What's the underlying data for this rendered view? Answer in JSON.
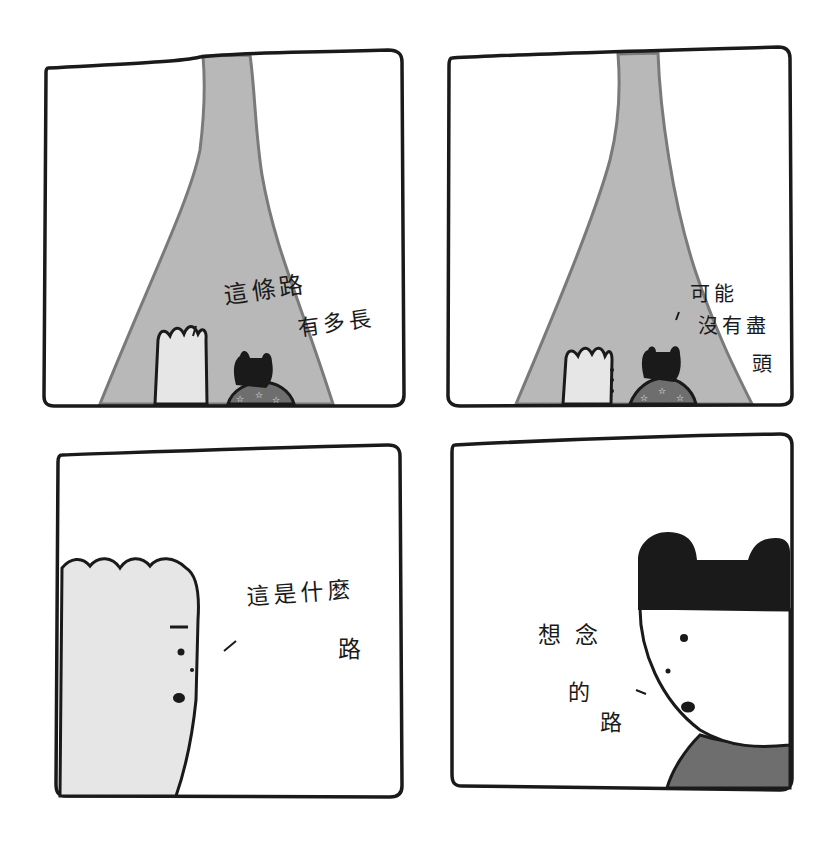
{
  "comic": {
    "panel_count": 4,
    "colors": {
      "ink": "#1a1a1a",
      "road": "#b8b8b8",
      "road_edge": "#7a7a7a",
      "skin_light": "#e6e6e6",
      "shirt": "#6e6e6e",
      "background": "#ffffff"
    },
    "panels": [
      {
        "id": 1,
        "lines": [
          "這條路",
          "有多長"
        ],
        "speaker_tick": "、"
      },
      {
        "id": 2,
        "lines": [
          "可能",
          "沒有盡",
          "頭"
        ],
        "speaker_tick": "、"
      },
      {
        "id": 3,
        "lines": [
          "這是什麼",
          "路"
        ],
        "speaker_tick": "、"
      },
      {
        "id": 4,
        "lines": [
          "想念",
          "的",
          "路"
        ],
        "speaker_tick": "、"
      }
    ]
  }
}
